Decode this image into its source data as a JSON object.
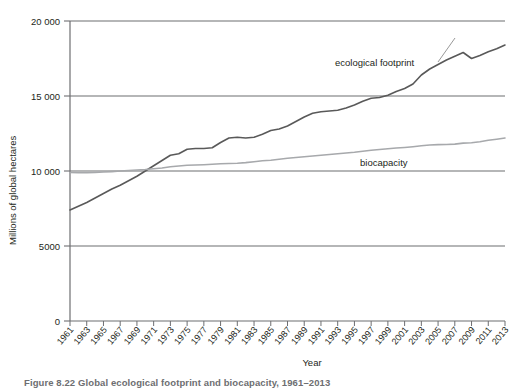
{
  "figure": {
    "caption": "Figure 8.22  Global ecological footprint and biocapacity, 1961–2013"
  },
  "chart_data": {
    "type": "line",
    "title": "",
    "xlabel": "Year",
    "ylabel": "Millions of global hectares",
    "xlim": [
      1961,
      2013
    ],
    "ylim": [
      0,
      20000
    ],
    "grid": true,
    "legend_position": "inline-annotation",
    "y_ticks": [
      "0",
      "5000",
      "10 000",
      "15 000",
      "20 000"
    ],
    "y_tick_values": [
      0,
      5000,
      10000,
      15000,
      20000
    ],
    "x_tick_labels": [
      "1961",
      "1963",
      "1965",
      "1967",
      "1969",
      "1971",
      "1973",
      "1975",
      "1977",
      "1979",
      "1981",
      "1983",
      "1985",
      "1987",
      "1989",
      "1991",
      "1993",
      "1995",
      "1997",
      "1999",
      "2001",
      "2003",
      "2005",
      "2007",
      "2009",
      "2011",
      "2013"
    ],
    "x": [
      1961,
      1962,
      1963,
      1964,
      1965,
      1966,
      1967,
      1968,
      1969,
      1970,
      1971,
      1972,
      1973,
      1974,
      1975,
      1976,
      1977,
      1978,
      1979,
      1980,
      1981,
      1982,
      1983,
      1984,
      1985,
      1986,
      1987,
      1988,
      1989,
      1990,
      1991,
      1992,
      1993,
      1994,
      1995,
      1996,
      1997,
      1998,
      1999,
      2000,
      2001,
      2002,
      2003,
      2004,
      2005,
      2006,
      2007,
      2008,
      2009,
      2010,
      2011,
      2012,
      2013
    ],
    "series": [
      {
        "name": "ecological footprint",
        "label": "ecological footprint",
        "color": "#595959",
        "values": [
          7400,
          7650,
          7900,
          8200,
          8500,
          8800,
          9050,
          9350,
          9650,
          10000,
          10350,
          10700,
          11050,
          11150,
          11450,
          11500,
          11500,
          11550,
          11900,
          12200,
          12250,
          12200,
          12250,
          12450,
          12700,
          12800,
          13000,
          13300,
          13600,
          13850,
          13950,
          14000,
          14050,
          14200,
          14400,
          14650,
          14850,
          14900,
          15050,
          15300,
          15500,
          15800,
          16400,
          16800,
          17100,
          17400,
          17650,
          17900,
          17500,
          17700,
          17950,
          18150,
          18400
        ]
      },
      {
        "name": "biocapacity",
        "label": "biocapacity",
        "color": "#a7a9ac",
        "values": [
          9900,
          9880,
          9880,
          9900,
          9930,
          9960,
          10000,
          10030,
          10070,
          10100,
          10150,
          10200,
          10280,
          10330,
          10380,
          10400,
          10420,
          10450,
          10480,
          10500,
          10520,
          10560,
          10620,
          10680,
          10720,
          10780,
          10850,
          10900,
          10950,
          11000,
          11050,
          11100,
          11150,
          11200,
          11250,
          11320,
          11380,
          11430,
          11480,
          11530,
          11570,
          11620,
          11680,
          11730,
          11760,
          11770,
          11790,
          11860,
          11880,
          11950,
          12050,
          12120,
          12200
        ]
      }
    ],
    "annotations": [
      {
        "text": "ecological footprint",
        "x_px": 335,
        "y_px": 66,
        "target": "ecological footprint"
      },
      {
        "text": "biocapacity",
        "x_px": 360,
        "y_px": 166,
        "target": "biocapacity"
      }
    ],
    "axis_color": "#6d6e71"
  }
}
